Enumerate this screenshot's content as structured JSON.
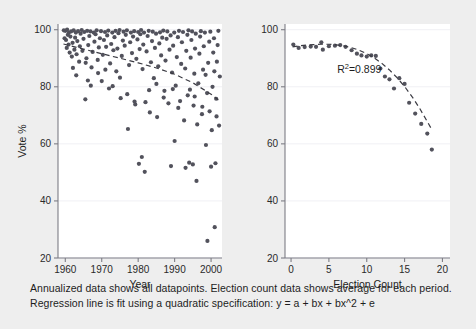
{
  "figure": {
    "background_color": "#eeeeee",
    "panel_color": "#ffffff",
    "point_color": "#52525c",
    "line_color": "#3a3a42",
    "axis_color": "#7d7d85",
    "grid_color": "#f0f0f4"
  },
  "caption": {
    "line1": "Annualized data shows all datapoints. Election count data shows average for each period.",
    "line2": "Regression line is fit using a quadratic specification: y = a + bx + bx^2 + e"
  },
  "chart_data": [
    {
      "type": "scatter",
      "id": "annualized-by-year",
      "title": "",
      "xlabel": "Year",
      "ylabel": "Vote %",
      "xlim": [
        1958,
        2003
      ],
      "ylim": [
        20,
        102
      ],
      "xticks": [
        1960,
        1970,
        1980,
        1990,
        2000
      ],
      "xtick_labels": [
        "1960",
        "1970",
        "1980",
        "1990",
        "2000"
      ],
      "yticks": [
        20,
        40,
        60,
        80,
        100
      ],
      "ytick_labels": [
        "20",
        "40",
        "60",
        "80",
        "100"
      ],
      "grid": true,
      "legend": "none",
      "trendline": {
        "style": "dashed",
        "x": [
          1959.5,
          1965,
          1970,
          1975,
          1980,
          1985,
          1990,
          1995,
          2000,
          2002
        ],
        "y": [
          95.0,
          93.2,
          91.6,
          90.0,
          88.4,
          86.6,
          84.4,
          81.4,
          77.4,
          75.4
        ]
      },
      "points": [
        [
          1959.6,
          99.8
        ],
        [
          1959.8,
          97.0
        ],
        [
          1960.0,
          99.6
        ],
        [
          1960.2,
          96.4
        ],
        [
          1960.4,
          93.6
        ],
        [
          1960.5,
          100.0
        ],
        [
          1960.7,
          98.2
        ],
        [
          1960.9,
          94.8
        ],
        [
          1961.0,
          99.0
        ],
        [
          1961.2,
          92.0
        ],
        [
          1961.4,
          97.6
        ],
        [
          1961.6,
          99.4
        ],
        [
          1961.8,
          90.6
        ],
        [
          1962.0,
          95.4
        ],
        [
          1962.3,
          99.8
        ],
        [
          1962.5,
          93.0
        ],
        [
          1962.7,
          97.2
        ],
        [
          1962.9,
          99.0
        ],
        [
          1963.1,
          91.4
        ],
        [
          1963.3,
          96.0
        ],
        [
          1963.5,
          99.5
        ],
        [
          1963.8,
          88.8
        ],
        [
          1964.0,
          94.2
        ],
        [
          1964.2,
          98.6
        ],
        [
          1964.5,
          99.9
        ],
        [
          1964.7,
          92.6
        ],
        [
          1965.0,
          96.8
        ],
        [
          1965.2,
          99.2
        ],
        [
          1965.5,
          75.6
        ],
        [
          1965.8,
          90.0
        ],
        [
          1966.0,
          99.6
        ],
        [
          1966.3,
          94.6
        ],
        [
          1966.6,
          97.8
        ],
        [
          1966.9,
          99.4
        ],
        [
          1967.2,
          86.8
        ],
        [
          1967.5,
          92.2
        ],
        [
          1967.8,
          99.0
        ],
        [
          1968.0,
          95.8
        ],
        [
          1968.3,
          98.4
        ],
        [
          1968.6,
          99.8
        ],
        [
          1968.9,
          89.4
        ],
        [
          1969.2,
          93.8
        ],
        [
          1969.5,
          97.0
        ],
        [
          1969.8,
          99.5
        ],
        [
          1970.0,
          82.0
        ],
        [
          1970.3,
          91.2
        ],
        [
          1970.6,
          96.4
        ],
        [
          1970.9,
          99.2
        ],
        [
          1971.2,
          94.0
        ],
        [
          1971.5,
          98.0
        ],
        [
          1971.8,
          99.7
        ],
        [
          1972.0,
          79.4
        ],
        [
          1972.3,
          88.2
        ],
        [
          1972.6,
          95.0
        ],
        [
          1972.9,
          99.0
        ],
        [
          1973.2,
          92.8
        ],
        [
          1973.5,
          97.4
        ],
        [
          1973.8,
          99.6
        ],
        [
          1974.0,
          85.4
        ],
        [
          1974.3,
          93.4
        ],
        [
          1974.6,
          98.8
        ],
        [
          1974.9,
          99.9
        ],
        [
          1975.2,
          76.0
        ],
        [
          1975.5,
          90.8
        ],
        [
          1975.8,
          96.2
        ],
        [
          1976.0,
          99.3
        ],
        [
          1976.3,
          94.4
        ],
        [
          1976.6,
          98.2
        ],
        [
          1976.9,
          99.8
        ],
        [
          1977.2,
          65.2
        ],
        [
          1977.5,
          87.6
        ],
        [
          1977.8,
          95.6
        ],
        [
          1978.0,
          99.0
        ],
        [
          1978.3,
          91.8
        ],
        [
          1978.6,
          97.6
        ],
        [
          1978.9,
          99.5
        ],
        [
          1979.2,
          73.8
        ],
        [
          1979.5,
          89.8
        ],
        [
          1979.8,
          96.6
        ],
        [
          1980.0,
          99.2
        ],
        [
          1980.2,
          53.0
        ],
        [
          1980.4,
          93.2
        ],
        [
          1980.6,
          98.4
        ],
        [
          1980.8,
          99.9
        ],
        [
          1981.0,
          55.4
        ],
        [
          1981.2,
          86.2
        ],
        [
          1981.4,
          94.8
        ],
        [
          1981.6,
          99.0
        ],
        [
          1981.8,
          50.2
        ],
        [
          1982.0,
          74.6
        ],
        [
          1982.3,
          92.4
        ],
        [
          1982.6,
          97.8
        ],
        [
          1982.9,
          99.6
        ],
        [
          1983.2,
          71.0
        ],
        [
          1983.5,
          88.6
        ],
        [
          1983.8,
          96.0
        ],
        [
          1984.0,
          99.3
        ],
        [
          1984.3,
          83.0
        ],
        [
          1984.6,
          93.6
        ],
        [
          1984.9,
          98.6
        ],
        [
          1985.2,
          69.4
        ],
        [
          1985.5,
          87.2
        ],
        [
          1985.8,
          95.2
        ],
        [
          1986.0,
          99.1
        ],
        [
          1986.3,
          91.0
        ],
        [
          1986.6,
          97.2
        ],
        [
          1986.9,
          99.7
        ],
        [
          1987.2,
          78.6
        ],
        [
          1987.5,
          89.2
        ],
        [
          1987.8,
          96.8
        ],
        [
          1988.0,
          99.4
        ],
        [
          1988.3,
          74.2
        ],
        [
          1988.6,
          93.0
        ],
        [
          1988.9,
          98.0
        ],
        [
          1989.0,
          52.2
        ],
        [
          1989.3,
          85.0
        ],
        [
          1989.6,
          94.4
        ],
        [
          1989.9,
          99.0
        ],
        [
          1990.0,
          61.0
        ],
        [
          1990.3,
          80.4
        ],
        [
          1990.6,
          90.4
        ],
        [
          1990.9,
          97.4
        ],
        [
          1991.2,
          99.6
        ],
        [
          1991.5,
          75.0
        ],
        [
          1991.8,
          88.0
        ],
        [
          1992.0,
          95.6
        ],
        [
          1992.3,
          99.2
        ],
        [
          1992.6,
          68.2
        ],
        [
          1992.9,
          86.4
        ],
        [
          1993.0,
          51.6
        ],
        [
          1993.2,
          92.6
        ],
        [
          1993.5,
          98.2
        ],
        [
          1993.8,
          99.8
        ],
        [
          1994.0,
          53.4
        ],
        [
          1994.2,
          79.0
        ],
        [
          1994.4,
          90.2
        ],
        [
          1994.6,
          96.4
        ],
        [
          1994.8,
          99.4
        ],
        [
          1995.0,
          52.8
        ],
        [
          1995.2,
          73.4
        ],
        [
          1995.4,
          84.6
        ],
        [
          1995.6,
          93.4
        ],
        [
          1995.8,
          98.6
        ],
        [
          1996.0,
          47.0
        ],
        [
          1996.2,
          66.8
        ],
        [
          1996.5,
          81.2
        ],
        [
          1996.8,
          91.6
        ],
        [
          1997.0,
          97.6
        ],
        [
          1997.2,
          99.5
        ],
        [
          1997.5,
          70.4
        ],
        [
          1997.8,
          86.0
        ],
        [
          1998.0,
          94.2
        ],
        [
          1998.3,
          99.0
        ],
        [
          1998.6,
          59.6
        ],
        [
          1998.9,
          77.8
        ],
        [
          1999.0,
          26.0
        ],
        [
          1999.2,
          88.4
        ],
        [
          1999.5,
          95.8
        ],
        [
          1999.8,
          99.3
        ],
        [
          2000.0,
          52.0
        ],
        [
          2000.2,
          64.8
        ],
        [
          2000.4,
          80.0
        ],
        [
          2000.6,
          92.0
        ],
        [
          2000.8,
          97.0
        ],
        [
          2001.0,
          30.8
        ],
        [
          2001.2,
          53.2
        ],
        [
          2001.4,
          75.8
        ],
        [
          2001.6,
          88.8
        ],
        [
          2001.8,
          94.6
        ],
        [
          2002.0,
          99.6
        ],
        [
          2002.2,
          66.4
        ],
        [
          2002.4,
          83.6
        ],
        [
          1963.0,
          84.0
        ],
        [
          1967.0,
          80.4
        ],
        [
          1971.0,
          86.0
        ],
        [
          1973.0,
          80.2
        ],
        [
          1977.0,
          77.4
        ],
        [
          1979.0,
          74.8
        ],
        [
          1983.0,
          78.8
        ],
        [
          1987.0,
          76.2
        ],
        [
          1991.0,
          72.6
        ],
        [
          1993.6,
          77.0
        ],
        [
          1997.6,
          73.0
        ],
        [
          1999.6,
          71.4
        ],
        [
          2001.5,
          69.6
        ],
        [
          1965.6,
          88.4
        ],
        [
          1969.0,
          84.8
        ],
        [
          1975.0,
          83.2
        ],
        [
          1985.0,
          81.0
        ],
        [
          1989.5,
          79.2
        ],
        [
          1995.5,
          76.6
        ],
        [
          1998.5,
          84.2
        ],
        [
          2000.9,
          85.4
        ],
        [
          1962.1,
          86.6
        ],
        [
          1966.2,
          82.2
        ]
      ]
    },
    {
      "type": "scatter",
      "id": "average-by-election-count",
      "title": "",
      "xlabel": "Election Count",
      "ylabel": "",
      "xlim": [
        -0.8,
        21
      ],
      "ylim": [
        20,
        102
      ],
      "xticks": [
        0,
        5,
        10,
        15,
        20
      ],
      "xtick_labels": [
        "0",
        "5",
        "10",
        "15",
        "20"
      ],
      "yticks": [
        20,
        40,
        60,
        80,
        100
      ],
      "ytick_labels": [
        "20",
        "40",
        "60",
        "80",
        "100"
      ],
      "grid": true,
      "legend": "none",
      "annotation": {
        "text": "R2=0.899",
        "base": "R",
        "sup": "2",
        "tail": "=0.899",
        "x": 6.1,
        "y": 85.0
      },
      "trendline": {
        "style": "dashed",
        "x": [
          0.2,
          1,
          2,
          3,
          4,
          5,
          6,
          7,
          8,
          9,
          10,
          11,
          12,
          13,
          14,
          15,
          16,
          17,
          18,
          18.6
        ],
        "y": [
          94.0,
          94.3,
          94.6,
          94.8,
          94.9,
          94.9,
          94.7,
          94.3,
          93.7,
          92.8,
          91.6,
          90.1,
          88.2,
          85.9,
          83.2,
          80.1,
          76.5,
          72.4,
          67.8,
          65.0
        ]
      },
      "points": [
        [
          0.3,
          94.8
        ],
        [
          1.0,
          93.6
        ],
        [
          1.8,
          93.9
        ],
        [
          2.6,
          94.1
        ],
        [
          3.3,
          94.0
        ],
        [
          4.0,
          95.6
        ],
        [
          4.2,
          93.0
        ],
        [
          5.0,
          94.2
        ],
        [
          5.8,
          94.4
        ],
        [
          6.5,
          94.6
        ],
        [
          7.2,
          94.0
        ],
        [
          8.0,
          92.8
        ],
        [
          8.7,
          91.6
        ],
        [
          9.3,
          91.0
        ],
        [
          10.0,
          90.6
        ],
        [
          10.6,
          91.0
        ],
        [
          11.2,
          90.8
        ],
        [
          11.8,
          86.4
        ],
        [
          12.4,
          83.6
        ],
        [
          13.0,
          82.6
        ],
        [
          13.6,
          79.4
        ],
        [
          14.3,
          83.0
        ],
        [
          15.0,
          81.0
        ],
        [
          15.6,
          74.4
        ],
        [
          16.4,
          70.6
        ],
        [
          17.2,
          67.0
        ],
        [
          18.0,
          63.6
        ],
        [
          18.6,
          58.0
        ]
      ]
    }
  ]
}
